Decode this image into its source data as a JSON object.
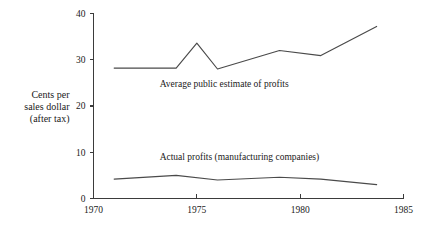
{
  "chart_data": {
    "type": "line",
    "title": "",
    "xlabel": "",
    "ylabel": "Cents per sales dollar (after tax)",
    "ylabel_lines": [
      "Cents per",
      "sales dollar",
      "(after tax)"
    ],
    "xlim": [
      1970,
      1985
    ],
    "ylim": [
      0,
      40
    ],
    "xticks": [
      1970,
      1975,
      1980,
      1985
    ],
    "xtick_labels": [
      "1970",
      "1975",
      "1980",
      "1985"
    ],
    "yticks": [
      0,
      10,
      20,
      30,
      40
    ],
    "ytick_labels": [
      "0",
      "10",
      "20",
      "30",
      "40"
    ],
    "grid": false,
    "legend_position": "inline-annotation",
    "line_color": "#4a4a4a",
    "axis_color": "#3b3b3b",
    "background_color": "#ffffff",
    "series": [
      {
        "name": "Average public estimate of profits",
        "annotation": "Average public estimate of profits",
        "annotation_x": 1973.2,
        "annotation_y": 24.2,
        "x": [
          1971.0,
          1974.0,
          1975.0,
          1976.0,
          1979.0,
          1981.0,
          1983.7
        ],
        "values": [
          28.2,
          28.2,
          33.6,
          28.0,
          32.0,
          30.9,
          37.2
        ]
      },
      {
        "name": "Actual profits (manufacturing companies)",
        "annotation": "Actual profits (manufacturing companies)",
        "annotation_x": 1973.2,
        "annotation_y": 8.4,
        "x": [
          1971.0,
          1974.0,
          1976.0,
          1979.0,
          1981.0,
          1983.7
        ],
        "values": [
          4.2,
          5.0,
          4.0,
          4.6,
          4.2,
          3.0
        ]
      }
    ]
  }
}
